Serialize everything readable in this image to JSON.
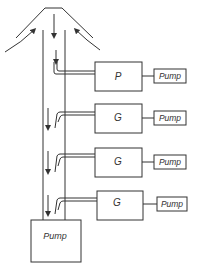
{
  "diagram": {
    "type": "flow-schematic",
    "hood": {
      "label": ""
    },
    "units": [
      {
        "id": "unit-1",
        "label": "P",
        "pump_label": "Pump"
      },
      {
        "id": "unit-2",
        "label": "G",
        "pump_label": "Pump"
      },
      {
        "id": "unit-3",
        "label": "G",
        "pump_label": "Pump"
      },
      {
        "id": "unit-4",
        "label": "G",
        "pump_label": "Pump"
      }
    ],
    "main_pump": {
      "label": "Pump"
    }
  },
  "colors": {
    "line": "#333333",
    "background": "#ffffff"
  }
}
